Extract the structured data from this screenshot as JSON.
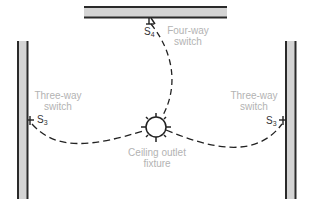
{
  "diagram": {
    "type": "wiring-plan",
    "colors": {
      "wall_fill": "#d4d4d4",
      "wall_border": "#2a2a2a",
      "wire": "#222222",
      "label": "#b3b3b3",
      "symbol": "#333333"
    },
    "walls": [
      {
        "id": "top",
        "x": 84,
        "y": 6,
        "w": 143,
        "h": 12
      },
      {
        "id": "left",
        "x": 17,
        "y": 41,
        "w": 11,
        "h": 158
      },
      {
        "id": "right",
        "x": 285,
        "y": 41,
        "w": 11,
        "h": 158
      }
    ],
    "switches": [
      {
        "id": "four-way",
        "symbol": "S",
        "subscript": "4",
        "label_line1": "Four-way",
        "label_line2": "switch"
      },
      {
        "id": "three-way-left",
        "symbol": "S",
        "subscript": "3",
        "label_line1": "Three-way",
        "label_line2": "switch"
      },
      {
        "id": "three-way-right",
        "symbol": "S",
        "subscript": "3",
        "label_line1": "Three-way",
        "label_line2": "switch"
      }
    ],
    "fixture": {
      "label_line1": "Ceiling outlet",
      "label_line2": "fixture",
      "cx": 156,
      "cy": 127,
      "r": 10
    }
  }
}
